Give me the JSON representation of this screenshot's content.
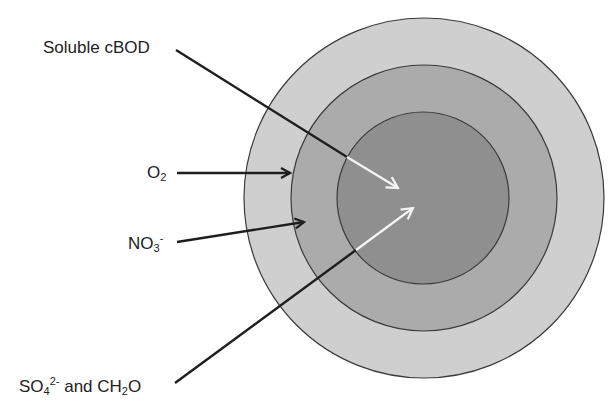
{
  "diagram": {
    "type": "concentric-zone-diagram",
    "zones": [
      {
        "name": "outer",
        "fill": "#cfcfcf",
        "cx": 424,
        "cy": 198,
        "r": 180
      },
      {
        "name": "middle",
        "fill": "#ababab",
        "cx": 424,
        "cy": 198,
        "r": 133
      },
      {
        "name": "inner",
        "fill": "#8f8f8f",
        "cx": 423,
        "cy": 198,
        "r": 86
      }
    ],
    "stroke_color": "#3a3a3a",
    "arrow_dark_color": "#1e1e1e",
    "arrow_light_color": "#f4f4f4"
  },
  "labels": {
    "soluble_cbod": {
      "text": "Soluble cBOD"
    },
    "o2": {
      "base": "O",
      "sub": "2"
    },
    "no3": {
      "base": "NO",
      "sub": "3",
      "sup": "-"
    },
    "so4_ch2o": {
      "base1": "SO",
      "sub1": "4",
      "sup1": "2-",
      "mid": " and CH",
      "sub2": "2",
      "end": "O"
    }
  }
}
